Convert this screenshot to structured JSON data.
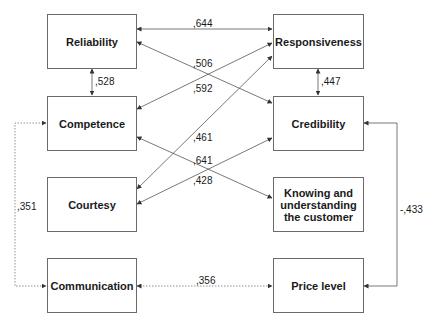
{
  "nodes": {
    "reliability": "Reliability",
    "responsiveness": "Responsiveness",
    "competence": "Competence",
    "credibility": "Credibility",
    "courtesy": "Courtesy",
    "knowing": "Knowing and\nunderstanding\nthe customer",
    "communication": "Communication",
    "price_level": "Price level"
  },
  "edges": [
    {
      "from": "Reliability",
      "to": "Responsiveness",
      "weight": ",644",
      "style": "solid"
    },
    {
      "from": "Reliability",
      "to": "Credibility",
      "weight": ",506",
      "style": "solid"
    },
    {
      "from": "Competence",
      "to": "Responsiveness",
      "weight": ",592",
      "style": "solid"
    },
    {
      "from": "Courtesy",
      "to": "Responsiveness",
      "weight": ",461",
      "style": "solid"
    },
    {
      "from": "Competence",
      "to": "Knowing and understanding the customer",
      "weight": ",641",
      "style": "solid"
    },
    {
      "from": "Courtesy",
      "to": "Credibility",
      "weight": ",428",
      "style": "solid"
    },
    {
      "from": "Reliability",
      "to": "Competence",
      "weight": ",528",
      "style": "solid"
    },
    {
      "from": "Responsiveness",
      "to": "Credibility",
      "weight": ",447",
      "style": "solid"
    },
    {
      "from": "Competence",
      "to": "Communication",
      "weight": ",351",
      "style": "dotted"
    },
    {
      "from": "Communication",
      "to": "Price level",
      "weight": ",356",
      "style": "dotted"
    },
    {
      "from": "Credibility",
      "to": "Price level",
      "weight": "-,433",
      "style": "solid"
    }
  ],
  "labels": {
    "w644": ",644",
    "w506": ",506",
    "w592": ",592",
    "w461": ",461",
    "w641": ",641",
    "w428": ",428",
    "w528": ",528",
    "w447": ",447",
    "w351": ",351",
    "w356": ",356",
    "w433": "-,433"
  },
  "colors": {
    "line": "#555555",
    "box_border": "#6a6a6a",
    "text": "#1a1a1a"
  }
}
